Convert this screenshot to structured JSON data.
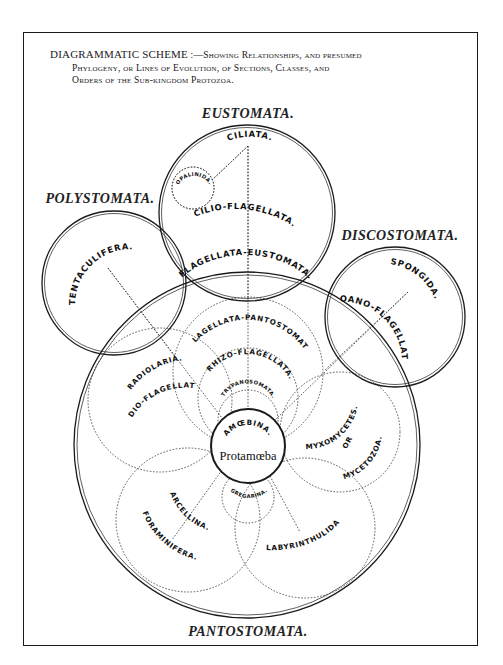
{
  "caption": {
    "lead": "DIAGRAMMATIC SCHEME",
    "separator": " :—",
    "line1_rest": "Showing Relationships, and presumed",
    "line2": "Phylogeny, or Lines of Evolution, of Sections, Classes, and",
    "line3": "Orders of the Sub-kingdom Protozoa."
  },
  "sections": {
    "eustomata": "EUSTOMATA.",
    "polystomata": "POLYSTOMATA.",
    "discostomata": "DISCOSTOMATA.",
    "pantostomata": "PANTOSTOMATA."
  },
  "groups": {
    "ciliata": "CILIATA.",
    "opalinida": "OPALINIDA.",
    "cilio_flagellata": "CILIO-FLAGELLATA.",
    "flagellata_eustomata": "FLAGELLATA-EUSTOMATA.",
    "tentaculifera": "TENTACULIFERA.",
    "spongida": "SPONGIDA.",
    "choano_flagellata": "CHOANO-FLAGELLATA.",
    "flagellata_pantostomata": "FLAGELLATA-PANTOSTOMATA.",
    "rhizo_flagellata": "RHIZO-FLAGELLATA.",
    "trypanosomata": "TRYPANOSOMATA.",
    "radiolaria": "RADIOLARIA.",
    "radio_flagellata": "RADIO-FLAGELLATA.",
    "amoebina": "AMŒBINA.",
    "protamoeba": "Protamœba",
    "myxomycetes": "MYXOMYCETES.",
    "or": "OR",
    "mycetozoa": "MYCETOZOA.",
    "arcellina": "ARCELLINA.",
    "foraminifera": "FORAMINIFERA.",
    "gregarina": "GREGARINA.",
    "labyrinthulida": "LABYRINTHULIDA"
  },
  "colors": {
    "ink": "#1a1a1a",
    "paper": "#ffffff"
  }
}
